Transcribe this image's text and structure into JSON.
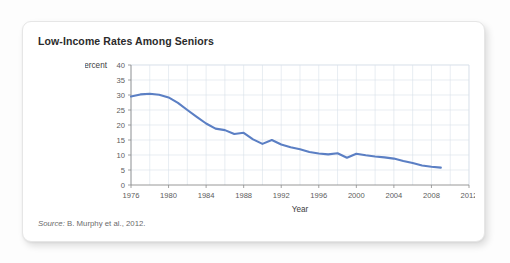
{
  "card": {
    "title": "Low-Income Rates Among Seniors",
    "source_label": "Source:",
    "source_text": " B. Murphy et al., 2012."
  },
  "chart_data": {
    "type": "line",
    "title": "Low-Income Rates Among Seniors",
    "xlabel": "Year",
    "ylabel": "Percent",
    "xlim": [
      1976,
      2012
    ],
    "ylim": [
      0,
      40
    ],
    "grid": true,
    "legend": false,
    "line_color": "#5b7fc4",
    "x_ticks": [
      1976,
      1980,
      1984,
      1988,
      1992,
      1996,
      2000,
      2004,
      2008,
      2012
    ],
    "y_ticks": [
      0,
      5,
      10,
      15,
      20,
      25,
      30,
      35,
      40
    ],
    "x_minor_step": 2,
    "series": [
      {
        "name": "Low-income rate among seniors",
        "x": [
          1976,
          1977,
          1978,
          1979,
          1980,
          1981,
          1982,
          1983,
          1984,
          1985,
          1986,
          1987,
          1988,
          1989,
          1990,
          1991,
          1992,
          1993,
          1994,
          1995,
          1996,
          1997,
          1998,
          1999,
          2000,
          2001,
          2002,
          2003,
          2004,
          2005,
          2006,
          2007,
          2008,
          2009
        ],
        "values": [
          29.5,
          30.2,
          30.4,
          30.1,
          29.2,
          27.4,
          25.0,
          22.7,
          20.5,
          18.8,
          18.3,
          17.0,
          17.4,
          15.2,
          13.7,
          15.0,
          13.5,
          12.6,
          11.9,
          11.0,
          10.5,
          10.2,
          10.6,
          9.1,
          10.4,
          9.9,
          9.5,
          9.2,
          8.8,
          8.0,
          7.3,
          6.5,
          6.1,
          5.8
        ]
      }
    ]
  }
}
